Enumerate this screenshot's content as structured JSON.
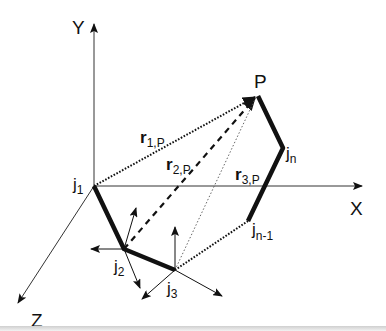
{
  "diagram": {
    "axes": {
      "x": "X",
      "y": "Y",
      "z": "Z"
    },
    "point": {
      "label": "P"
    },
    "joints": [
      {
        "id": "j1",
        "base": "j",
        "sub": "1"
      },
      {
        "id": "j2",
        "base": "j",
        "sub": "2"
      },
      {
        "id": "j3",
        "base": "j",
        "sub": "3"
      },
      {
        "id": "jn1",
        "base": "j",
        "sub": "n-1"
      },
      {
        "id": "jn",
        "base": "j",
        "sub": "n"
      }
    ],
    "vectors": [
      {
        "id": "r1p",
        "base": "r",
        "sub": "1,P",
        "style": "dotted"
      },
      {
        "id": "r2p",
        "base": "r",
        "sub": "2,P",
        "style": "dashed"
      },
      {
        "id": "r3p",
        "base": "r",
        "sub": "3,P",
        "style": "fine-dotted"
      }
    ],
    "colors": {
      "ink": "#111111",
      "background": "#ffffff"
    }
  }
}
